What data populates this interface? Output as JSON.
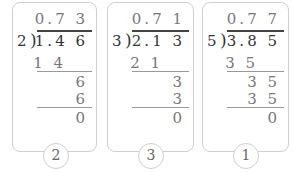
{
  "problems": [
    {
      "divisor": "2",
      "dividend": "1.4 6",
      "quotient": "0.7 3",
      "steps": [
        "1 4",
        "6",
        "6",
        "0"
      ],
      "label": "2"
    },
    {
      "divisor": "3",
      "dividend": "2.1 3",
      "quotient": "0.7 1",
      "steps": [
        "2 1",
        "3",
        "3",
        "0"
      ],
      "label": "3"
    },
    {
      "divisor": "5",
      "dividend": "3.8 5",
      "quotient": "0.7 7",
      "steps": [
        "3 5",
        "3 5",
        "3 5",
        "0"
      ],
      "label": "1"
    }
  ]
}
